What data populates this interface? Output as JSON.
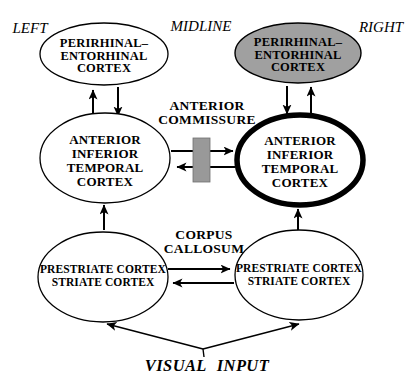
{
  "orientation_labels": {
    "left": "LEFT",
    "midline": "MIDLINE",
    "right": "RIGHT"
  },
  "nodes": {
    "left_perirhinal_entorhinal": {
      "lines": [
        "PERIRHINAL–",
        "ENTORHINAL",
        "CORTEX"
      ]
    },
    "right_perirhinal_entorhinal": {
      "lines": [
        "PERIRHINAL–",
        "ENTORHINAL",
        "CORTEX"
      ]
    },
    "left_anterior_inferior_temporal": {
      "lines": [
        "ANTERIOR",
        "INFERIOR",
        "TEMPORAL",
        "CORTEX"
      ]
    },
    "right_anterior_inferior_temporal": {
      "lines": [
        "ANTERIOR",
        "INFERIOR",
        "TEMPORAL",
        "CORTEX"
      ]
    },
    "left_prestriate_striate": {
      "lines": [
        "PRESTRIATE CORTEX",
        "STRIATE CORTEX"
      ]
    },
    "right_prestriate_striate": {
      "lines": [
        "PRESTRIATE CORTEX",
        "STRIATE CORTEX"
      ]
    }
  },
  "connectors": {
    "anterior_commissure": {
      "lines": [
        "ANTERIOR",
        "COMMISSURE"
      ]
    },
    "corpus_callosum": {
      "lines": [
        "CORPUS",
        "CALLOSUM"
      ]
    }
  },
  "input_label": "VISUAL INPUT",
  "colors": {
    "background": "#ffffff",
    "line_color": "#000000",
    "right_perirhinal_fill": "#a0a0a0",
    "commissure_bar_fill": "#999999",
    "white_node_fill": "#ffffff"
  }
}
